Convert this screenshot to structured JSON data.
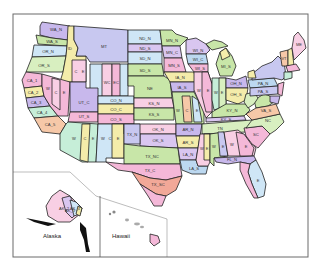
{
  "map": {
    "title": "US State Plane / Zone Map",
    "insets": {
      "alaska": {
        "label": "Alaska"
      },
      "hawaii": {
        "label": "Hawaii"
      }
    },
    "zones": {
      "WA_N": "WA_N",
      "WA_S": "WA_S",
      "OR_N": "OR_N",
      "OR_S": "OR_S",
      "ID_N": "ID",
      "ID_W": "W",
      "ID_C": "C",
      "ID_E": "E",
      "MT": "MT",
      "WY_W": "W",
      "WY_WC": "WC",
      "WY_EC": "EC",
      "WY_E": "E",
      "ND_N": "ND_N",
      "ND_S": "ND_S",
      "SD_N": "SD_N",
      "SD_S": "SD_S",
      "NE": "NE",
      "KS_N": "KS_N",
      "KS_S": "KS_S",
      "CA_1": "CA_1",
      "CA_2": "CA_2",
      "CA_3": "CA_3",
      "CA_4": "CA_4",
      "CA_5": "CA_5",
      "NV_W": "W",
      "NV_C": "C",
      "NV_E": "E",
      "UT_N": "UT_N",
      "UT_C": "UT_C",
      "UT_S": "UT_S",
      "CO_N": "CO_N",
      "CO_C": "CO_C",
      "CO_S": "CO_S",
      "AZ_W": "W",
      "AZ_C": "C",
      "AZ_E": "E",
      "NM_W": "W",
      "NM_C": "C",
      "NM_E": "E",
      "TX_N": "TX_N",
      "TX_NC": "TX_NC",
      "TX_C": "TX_C",
      "TX_SC": "TX_SC",
      "OK_N": "OK_N",
      "OK_S": "OK_S",
      "MN_N": "MN_N",
      "MN_C": "MN_C",
      "MN_S": "MN_S",
      "IA_N": "IA_N",
      "IA_S": "IA_S",
      "MO_W": "W",
      "MO_C": "C",
      "MO_E": "E",
      "AR_N": "AR_N",
      "AR_S": "AR_S",
      "LA_N": "LA_N",
      "LA_S": "LA_S",
      "WI_N": "WI_N",
      "WI_C": "WI_C",
      "WI_S": "WI_S",
      "IL_W": "W",
      "IL_E": "E",
      "MI_N": "MI_N",
      "MI_C": "MI_C",
      "MI_S": "MI_S",
      "IN_W": "W",
      "IN_E": "E",
      "OH_N": "OH_N",
      "OH_S": "OH_S",
      "KY_N": "KY_N",
      "KY_S": "KY_S",
      "TN": "TN",
      "MS_W": "W",
      "MS_E": "E",
      "AL_W": "W",
      "AL_E": "E",
      "GA_W": "W",
      "GA_E": "E",
      "FL_N": "FL_N",
      "FL_E": "E",
      "FL_W": "W",
      "SC": "SC",
      "NC": "NC",
      "VA_N": "VA_N",
      "VA_S": "VA_S",
      "WV": "WV",
      "PA_N": "PA_N",
      "PA_S": "PA_S",
      "NY": "NY",
      "VT": "VT",
      "NH": "NH",
      "ME_E": "ME",
      "AK_2": "AK_2",
      "AK_3": "AK_3",
      "AK_4": "AK_4",
      "AK_5": "AK_5"
    },
    "colors": {
      "purple": "#c8b8ec",
      "lilac": "#d9c6f0",
      "green": "#c8e6a8",
      "lightgreen": "#d8efc0",
      "pink": "#f4b8d8",
      "lightpink": "#f8cfe4",
      "blue": "#bcd8f0",
      "lightblue": "#cfe6f6",
      "yellow": "#f4ecaa",
      "peach": "#f6c8a8",
      "salmon": "#f2a898",
      "mint": "#c6eed8",
      "lavender": "#c8c8f0"
    }
  }
}
